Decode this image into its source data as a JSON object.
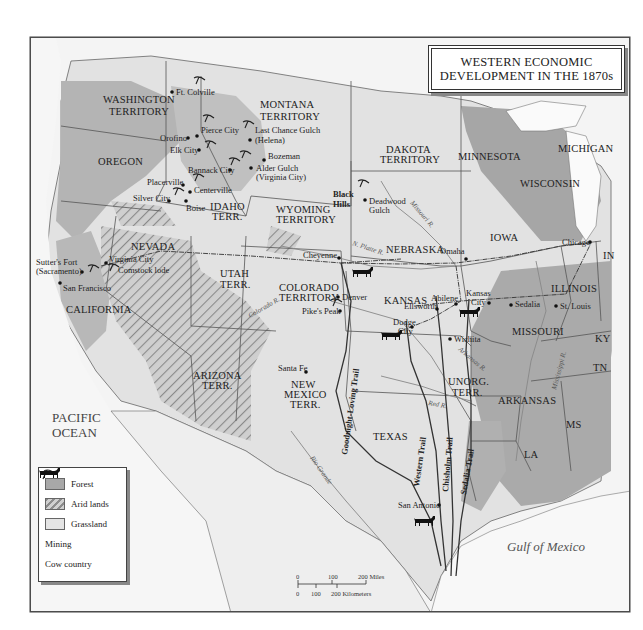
{
  "title": {
    "line1": "WESTERN ECONOMIC",
    "line2": "DEVELOPMENT IN THE 1870s"
  },
  "legend": {
    "items": [
      {
        "label": "Forest",
        "icon": "forest-swatch",
        "color": "#a8a8a8"
      },
      {
        "label": "Arid lands",
        "icon": "hatched-swatch",
        "color": "#c8c8c8"
      },
      {
        "label": "Grassland",
        "icon": "grassland-swatch",
        "color": "#e4e4e4"
      },
      {
        "label": "Mining",
        "icon": "pickaxe-icon"
      },
      {
        "label": "Cow country",
        "icon": "cow-icon"
      }
    ]
  },
  "scale": {
    "miles": [
      "0",
      "100",
      "200 Miles"
    ],
    "kilometers": [
      "0",
      "100",
      "200 Kilometers"
    ]
  },
  "water": {
    "pacific_line1": "PACIFIC",
    "pacific_line2": "OCEAN",
    "gulf": "Gulf of Mexico"
  },
  "regions": {
    "washington_1": "WASHINGTON",
    "washington_2": "TERRITORY",
    "oregon": "OREGON",
    "montana_1": "MONTANA",
    "montana_2": "TERRITORY",
    "idaho_1": "IDAHO",
    "idaho_2": "TERR.",
    "dakota_1": "DAKOTA",
    "dakota_2": "TERRITORY",
    "minnesota": "MINNESOTA",
    "michigan": "MICHIGAN",
    "wisconsin": "WISCONSIN",
    "wyoming_1": "WYOMING",
    "wyoming_2": "TERRITORY",
    "nevada": "NEVADA",
    "california": "CALIFORNIA",
    "utah_1": "UTAH",
    "utah_2": "TERR.",
    "colorado_1": "COLORADO",
    "colorado_2": "TERRITORY",
    "nebraska": "NEBRASKA",
    "iowa": "IOWA",
    "illinois": "ILLINOIS",
    "indiana": "IN",
    "kansas": "KANSAS",
    "missouri": "MISSOURI",
    "kentucky": "KY",
    "tennessee": "TN",
    "arizona_1": "ARIZONA",
    "arizona_2": "TERR.",
    "new_mexico_1": "NEW",
    "new_mexico_2": "MEXICO",
    "new_mexico_3": "TERR.",
    "unorg_1": "UNORG.",
    "unorg_2": "TERR.",
    "arkansas": "ARKANSAS",
    "texas": "TEXAS",
    "mississippi": "MS",
    "louisiana": "LA",
    "black_hills_1": "Black",
    "black_hills_2": "Hills"
  },
  "places": {
    "ft_colville": "Ft. Colville",
    "orofino": "Orofino",
    "pierce_city": "Pierce City",
    "elk_city": "Elk City",
    "last_chance_1": "Last Chance Gulch",
    "last_chance_2": "(Helena)",
    "bozeman": "Bozeman",
    "bannack": "Bannack City",
    "alder_1": "Alder Gulch",
    "alder_2": "(Virginia City)",
    "placerville": "Placerville",
    "centerville": "Centerville",
    "silver_city": "Silver City",
    "boise": "Boise",
    "deadwood_1": "Deadwood",
    "deadwood_2": "Gulch",
    "sutters_1": "Sutter's Fort",
    "sutters_2": "(Sacramento)",
    "virginia_city_nv": "Virginia City",
    "comstock": "Comstock lode",
    "san_francisco": "San Francisco",
    "cheyenne": "Cheyenne",
    "omaha": "Omaha",
    "chicago": "Chicago",
    "denver": "Denver",
    "pikes_peak": "Pike's Peak",
    "abilene": "Abilene",
    "kansas_city_1": "Kansas",
    "kansas_city_2": "City",
    "sedalia": "Sedalia",
    "st_louis": "St. Louis",
    "ellsworth": "Ellsworth",
    "dodge_1": "Dodge",
    "dodge_2": "City",
    "wichita": "Wichita",
    "santa_fe": "Santa Fe",
    "san_antonio": "San Antonio"
  },
  "rivers": {
    "missouri": "Missouri R.",
    "n_platte": "N. Platte R.",
    "arkansas": "Arkansas R.",
    "red": "Red R.",
    "rio_grande": "Rio Grande",
    "mississippi": "Mississippi R.",
    "colorado": "Colorado R."
  },
  "trails": {
    "goodnight_loving": "Goodnight-Loving Trail",
    "western": "Western Trail",
    "chisholm": "Chisholm Trail",
    "sedalia": "Sedalia Trail"
  },
  "colors": {
    "forest": "#a8a8a8",
    "arid": "#c8c8c8",
    "grassland": "#e4e4e4",
    "water": "#ffffff",
    "border": "#444444"
  }
}
